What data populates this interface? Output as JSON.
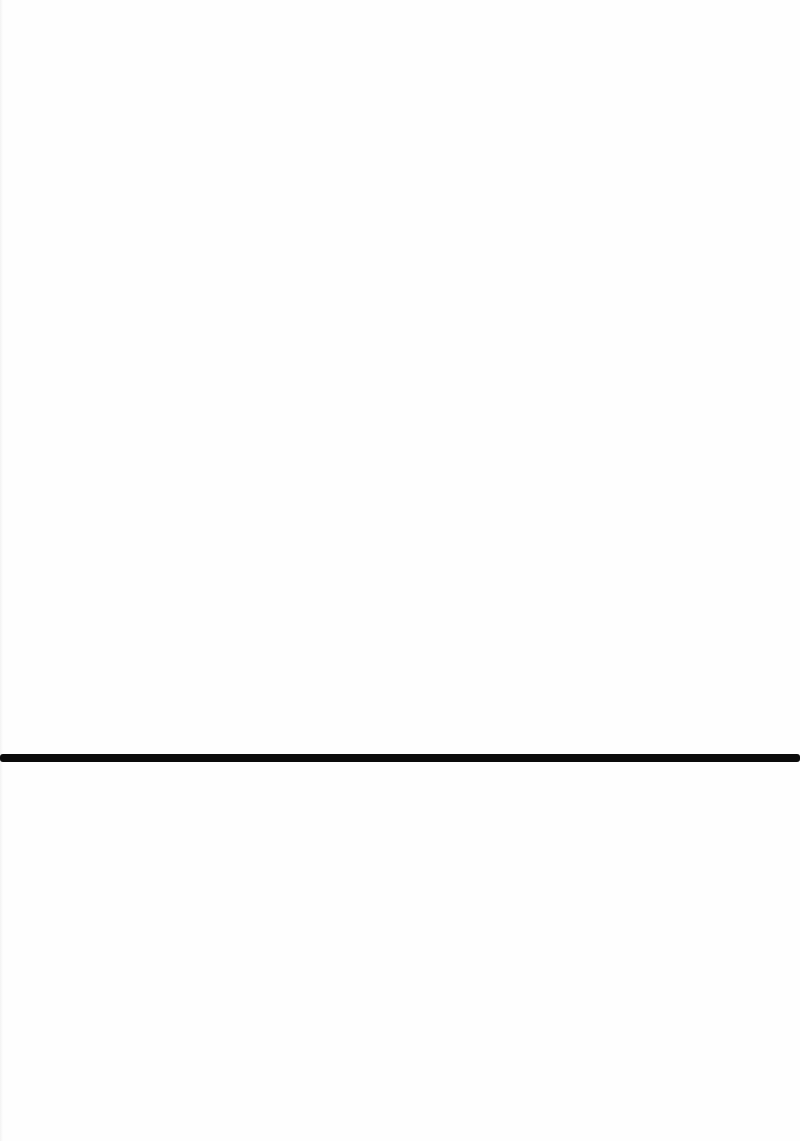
{
  "page": {
    "background": "#fefefe",
    "width": 800,
    "height": 1141
  },
  "rule": {
    "color": "#0b0b0b",
    "top": 754,
    "thickness": 8
  }
}
